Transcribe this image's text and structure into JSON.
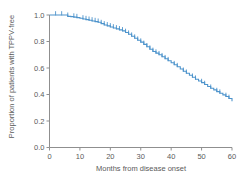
{
  "chart_data": {
    "type": "line",
    "subtype": "kaplan_meier_step",
    "title": "",
    "xlabel": "Months from disease onset",
    "ylabel": "Proportion of patients with TPPV-free",
    "xlim": [
      0,
      60
    ],
    "ylim": [
      0,
      1.0
    ],
    "xticks": [
      "0",
      "10",
      "20",
      "30",
      "40",
      "50",
      "60"
    ],
    "xtick_values": [
      0,
      10,
      20,
      30,
      40,
      50,
      60
    ],
    "yticks": [
      "0.0",
      "0.2",
      "0.4",
      "0.6",
      "0.8",
      "1.0"
    ],
    "ytick_values": [
      0,
      0.2,
      0.4,
      0.6,
      0.8,
      1.0
    ],
    "grid": false,
    "legend": null,
    "colors": {
      "line": "#4e94cc",
      "axis": "#8f8f8f",
      "text": "#5a5a5a",
      "background": "#ffffff"
    },
    "series": [
      {
        "name": "TPPV-free proportion",
        "x": [
          0,
          5,
          6,
          7,
          8,
          9,
          10,
          11,
          12,
          13,
          14,
          15,
          16,
          17,
          18,
          19,
          20,
          21,
          22,
          23,
          24,
          25,
          26,
          27,
          28,
          29,
          30,
          31,
          32,
          33,
          34,
          35,
          36,
          37,
          38,
          39,
          40,
          41,
          42,
          43,
          44,
          45,
          46,
          47,
          48,
          49,
          50,
          51,
          52,
          53,
          54,
          55,
          56,
          57,
          58,
          59,
          60
        ],
        "y": [
          1.0,
          1.0,
          0.99,
          0.988,
          0.984,
          0.98,
          0.975,
          0.97,
          0.965,
          0.96,
          0.955,
          0.95,
          0.945,
          0.935,
          0.925,
          0.918,
          0.91,
          0.902,
          0.895,
          0.888,
          0.88,
          0.868,
          0.855,
          0.84,
          0.825,
          0.81,
          0.795,
          0.778,
          0.76,
          0.742,
          0.725,
          0.712,
          0.7,
          0.685,
          0.67,
          0.655,
          0.64,
          0.625,
          0.61,
          0.592,
          0.575,
          0.56,
          0.545,
          0.53,
          0.515,
          0.502,
          0.49,
          0.475,
          0.46,
          0.447,
          0.435,
          0.422,
          0.41,
          0.397,
          0.385,
          0.37,
          0.35
        ]
      }
    ],
    "censor_marks_x": [
      2,
      4,
      6,
      8,
      9,
      11,
      12,
      13,
      14,
      15,
      16,
      17,
      18,
      19,
      20,
      21,
      22,
      23,
      24,
      25,
      26,
      27,
      28,
      29,
      30,
      31,
      32,
      33,
      34,
      35,
      36,
      37,
      38,
      39,
      41,
      42,
      44,
      45,
      47,
      48,
      50,
      51,
      53,
      55,
      56,
      58,
      59
    ]
  }
}
